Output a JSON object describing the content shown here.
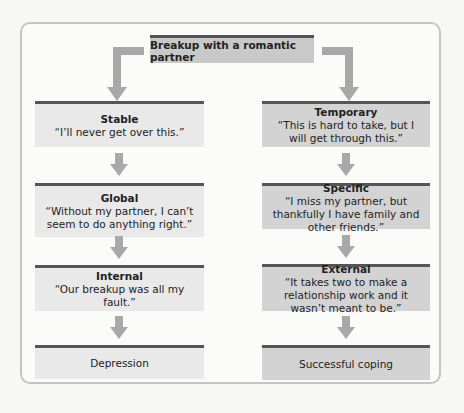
{
  "top": {
    "label": "Breakup with a romantic partner"
  },
  "left": [
    {
      "title": "Stable",
      "quote": "“I’ll never get over this.”"
    },
    {
      "title": "Global",
      "quote": "“Without my partner, I can’t seem to do anything right.”"
    },
    {
      "title": "Internal",
      "quote": "“Our breakup was all my fault.”"
    },
    {
      "title": "Depression",
      "quote": ""
    }
  ],
  "right": [
    {
      "title": "Temporary",
      "quote": "“This is hard to take, but I will get through this.”"
    },
    {
      "title": "Specific",
      "quote": "“I miss my partner, but thankfully I have family and other friends.”"
    },
    {
      "title": "External",
      "quote": "“It takes two to make a relationship work and it wasn’t meant to be.”"
    },
    {
      "title": "Successful coping",
      "quote": ""
    }
  ],
  "colors": {
    "left_box": "#e9e9e9",
    "right_box": "#d3d3d3",
    "arrow": "#a8a8a8",
    "border_top": "#555555"
  }
}
